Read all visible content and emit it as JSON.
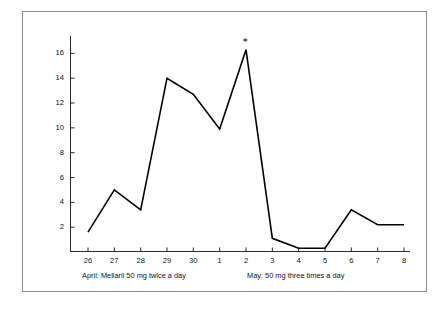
{
  "figure": {
    "background": "#ffffff",
    "frame_color": "#8d8d8d",
    "line_color": "#000000"
  },
  "annotations": {
    "asterisk": "*",
    "asterisk_at_category": "2"
  },
  "captions": {
    "april": "April: Mellaril 50 mg twice a day",
    "may": "May: 50 mg three times a day"
  },
  "chart_data": {
    "type": "line",
    "title": "",
    "xlabel": "",
    "ylabel": "Number of tantrums",
    "categories": [
      "26",
      "27",
      "28",
      "29",
      "30",
      "1",
      "2",
      "3",
      "4",
      "5",
      "6",
      "7",
      "8"
    ],
    "values": [
      1.6,
      5.0,
      3.4,
      14.0,
      12.7,
      9.9,
      16.3,
      1.1,
      0.3,
      0.3,
      3.4,
      2.2,
      2.2
    ],
    "yticks": [
      2,
      4,
      6,
      8,
      10,
      12,
      14,
      16
    ],
    "ytick_labels": [
      "2",
      "4",
      "6",
      "8",
      "10",
      "12",
      "14",
      "16"
    ],
    "ylim": [
      0,
      17.4
    ],
    "grid": false,
    "legend": "none",
    "series": [
      {
        "name": "Number of tantrums",
        "values": [
          1.6,
          5.0,
          3.4,
          14.0,
          12.7,
          9.9,
          16.3,
          1.1,
          0.3,
          0.3,
          3.4,
          2.2,
          2.2
        ]
      }
    ],
    "annotations": [
      {
        "text": "*",
        "category": "2",
        "value": 16.3
      }
    ],
    "phase_labels": [
      "April: Mellaril 50 mg twice a day",
      "May: 50 mg three times a day"
    ]
  }
}
